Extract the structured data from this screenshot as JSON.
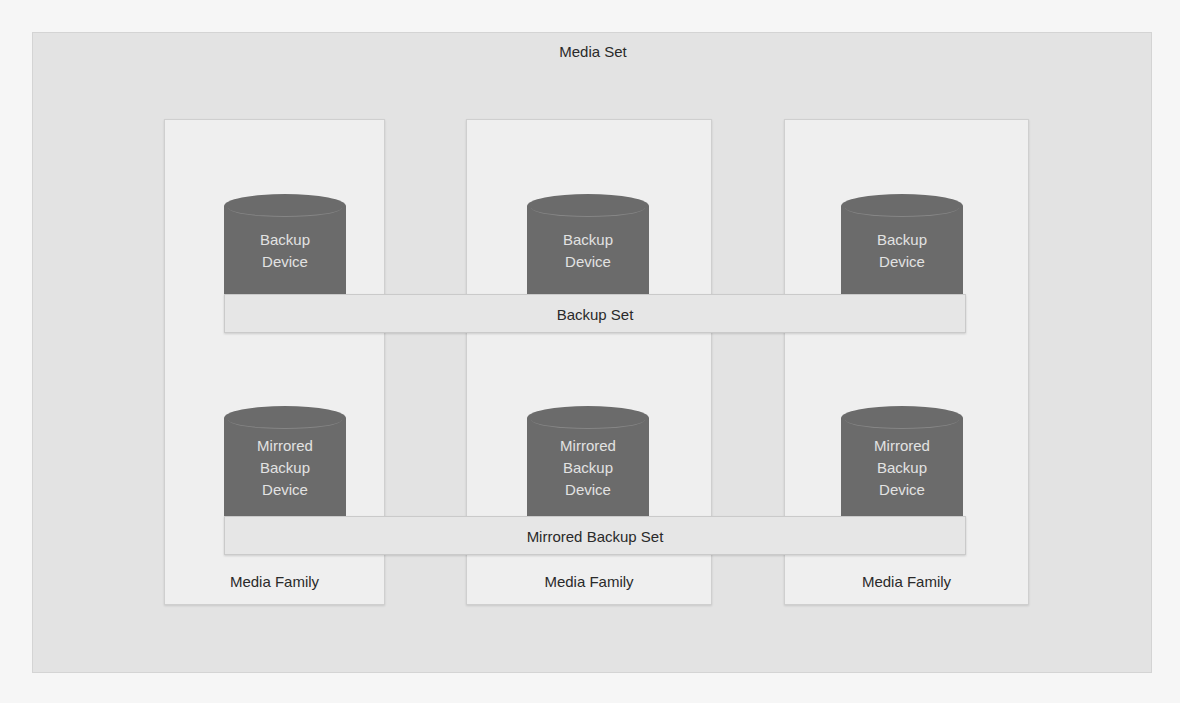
{
  "diagram": {
    "title": "Media Set",
    "colors": {
      "outer_background": "#e3e3e3",
      "family_background": "#efefef",
      "device_fill": "#6b6b6b",
      "device_text": "#e2e2e2",
      "set_bar": "#e6e6e6"
    },
    "media_families": [
      {
        "label": "Media Family",
        "backup_device": {
          "line1": "Backup",
          "line2": "Device"
        },
        "mirrored_device": {
          "line1": "Mirrored",
          "line2": "Backup",
          "line3": "Device"
        }
      },
      {
        "label": "Media Family",
        "backup_device": {
          "line1": "Backup",
          "line2": "Device"
        },
        "mirrored_device": {
          "line1": "Mirrored",
          "line2": "Backup",
          "line3": "Device"
        }
      },
      {
        "label": "Media Family",
        "backup_device": {
          "line1": "Backup",
          "line2": "Device"
        },
        "mirrored_device": {
          "line1": "Mirrored",
          "line2": "Backup",
          "line3": "Device"
        }
      }
    ],
    "backup_set_label": "Backup Set",
    "mirrored_backup_set_label": "Mirrored Backup Set"
  }
}
